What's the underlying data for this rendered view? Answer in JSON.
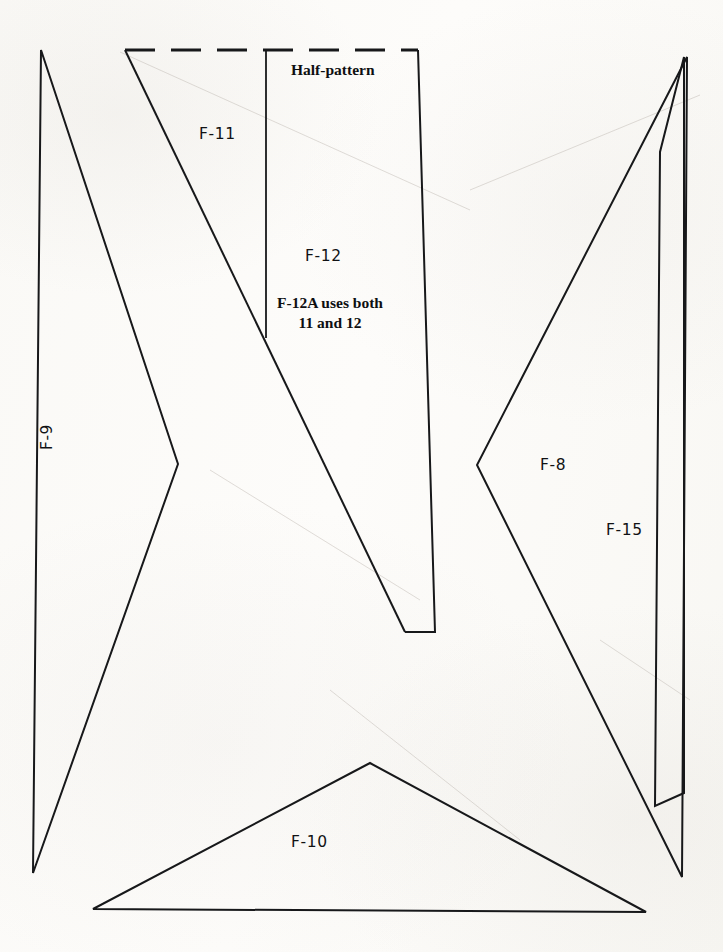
{
  "document": {
    "type": "sewing-pattern-layout-sheet",
    "background_color": "#fbfaf8",
    "ink_color": "#17181a"
  },
  "annotations": {
    "half_pattern_note": "Half-pattern",
    "combined_note_line1": "F-12A uses both",
    "combined_note_line2": "11 and 12"
  },
  "pieces": [
    {
      "id": "F-9",
      "label": "F-9",
      "label_x": 55,
      "label_y": 438,
      "rotated": true,
      "outline": "41,50 33,873 178,464"
    },
    {
      "id": "F-11",
      "label": "F-11",
      "label_x": 207,
      "label_y": 133,
      "rotated": false,
      "outline": "125,50 266,338"
    },
    {
      "id": "F-12",
      "label": "F-12",
      "label_x": 310,
      "label_y": 254,
      "rotated": false,
      "outline": "418,50 435,632 405,632"
    },
    {
      "id": "F-8",
      "label": "F-8",
      "label_x": 547,
      "label_y": 465,
      "rotated": false,
      "outline": "687,57 477,465 682,877"
    },
    {
      "id": "F-15",
      "label": "F-15",
      "label_x": 610,
      "label_y": 530,
      "rotated": false,
      "outline": "660,152 655,806 684,57 684,793"
    },
    {
      "id": "F-10",
      "label": "F-10",
      "label_x": 297,
      "label_y": 841,
      "rotated": false,
      "outline": "370,763 93,909 646,912"
    }
  ],
  "geometry": {
    "fold_edge": {
      "from_x": 125,
      "from_y": 50,
      "to_x": 418,
      "to_y": 50,
      "style": "dashed"
    },
    "f9_outline": "M41,50 L33,873 L178,464 Z",
    "f11_f12_outline": "M125,50 L405,632 M418,50 L435,632 L405,632",
    "f11_divider": "M266,50 L266,338",
    "f8_outline": "M687,57 L477,465 L682,877 Z",
    "f15_outline": "M660,152 L655,806 L684,793 L684,57 Z",
    "f10_outline": "M370,763 L93,909 L646,912 Z"
  }
}
